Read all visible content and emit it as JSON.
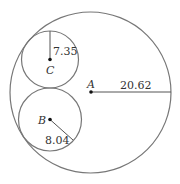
{
  "diagram": {
    "circles": [
      {
        "id": "A",
        "label": "A",
        "cx": 90.5,
        "cy": 92.5,
        "r": 80.5,
        "radius_value": "20.62"
      },
      {
        "id": "C",
        "label": "C",
        "cx": 50,
        "cy": 59.5,
        "r": 28.5,
        "radius_value": "7.35"
      },
      {
        "id": "B",
        "label": "B",
        "cx": 50,
        "cy": 119.5,
        "r": 31.5,
        "radius_value": "8.04"
      }
    ],
    "stroke_color": "#777777",
    "point_color": "#111111"
  }
}
